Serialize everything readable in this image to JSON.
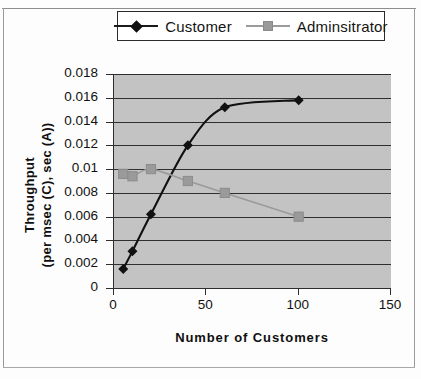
{
  "chart_data": {
    "type": "line",
    "title": "",
    "xlabel": "Number of Customers",
    "ylabel": "Throughput\n(per msec (C), sec (A))",
    "ylabel_line1": "Throughput",
    "ylabel_line2": "(per msec (C), sec (A))",
    "xlim": [
      0,
      150
    ],
    "ylim": [
      0,
      0.018
    ],
    "xticks": [
      "0",
      "50",
      "100",
      "150"
    ],
    "xtick_values": [
      0,
      50,
      100,
      150
    ],
    "yticks": [
      "0",
      "0.002",
      "0.004",
      "0.006",
      "0.008",
      "0.01",
      "0.012",
      "0.014",
      "0.016",
      "0.018"
    ],
    "ytick_values": [
      0,
      0.002,
      0.004,
      0.006,
      0.008,
      0.01,
      0.012,
      0.014,
      0.016,
      0.018
    ],
    "grid": "horizontal",
    "legend_position": "top-center",
    "plot_background": "#c3c3c3",
    "series": [
      {
        "name": "Customer",
        "color": "#111111",
        "marker": "diamond",
        "x": [
          5,
          10,
          20,
          40,
          60,
          100
        ],
        "values": [
          0.0016,
          0.0031,
          0.0062,
          0.012,
          0.0152,
          0.0158
        ]
      },
      {
        "name": "Adminsitrator",
        "color": "#9a9a9a",
        "marker": "square",
        "x": [
          5,
          10,
          20,
          40,
          60,
          100
        ],
        "values": [
          0.0096,
          0.0094,
          0.01,
          0.009,
          0.008,
          0.006
        ]
      }
    ]
  },
  "legend": {
    "entries": [
      {
        "label": "Customer"
      },
      {
        "label": "Adminsitrator"
      }
    ]
  }
}
